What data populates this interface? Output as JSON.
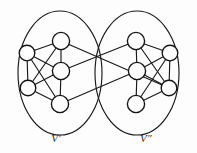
{
  "figure": {
    "type": "graph-diagram",
    "background_color": "#fdfdfd",
    "stroke_color": "#1a1a1a",
    "node_fill": "#ffffff"
  },
  "labels": {
    "left_cluster": "V′",
    "right_cluster": "V″"
  },
  "clusters": [
    {
      "id": "left",
      "label_key": "left_cluster",
      "ellipse": {
        "cx": 60,
        "cy": 73,
        "rx": 42,
        "ry": 62
      },
      "label_pos": {
        "x": 56,
        "y": 142
      },
      "nodes": [
        {
          "id": "L1",
          "cx": 61,
          "cy": 41,
          "r": 8.6
        },
        {
          "id": "L2",
          "cx": 27,
          "cy": 53,
          "r": 7.8
        },
        {
          "id": "L3",
          "cx": 61,
          "cy": 71,
          "r": 8.6
        },
        {
          "id": "L4",
          "cx": 28,
          "cy": 88,
          "r": 7.8
        },
        {
          "id": "L5",
          "cx": 60,
          "cy": 104,
          "r": 8.6
        }
      ],
      "edges": [
        [
          "L1",
          "L2"
        ],
        [
          "L1",
          "L3"
        ],
        [
          "L1",
          "L4"
        ],
        [
          "L2",
          "L3"
        ],
        [
          "L2",
          "L4"
        ],
        [
          "L2",
          "L5"
        ],
        [
          "L3",
          "L4"
        ],
        [
          "L3",
          "L5"
        ],
        [
          "L4",
          "L5"
        ]
      ]
    },
    {
      "id": "right",
      "label_key": "right_cluster",
      "ellipse": {
        "cx": 137,
        "cy": 73,
        "rx": 42,
        "ry": 62
      },
      "label_pos": {
        "x": 146,
        "y": 142
      },
      "nodes": [
        {
          "id": "R1",
          "cx": 136,
          "cy": 41,
          "r": 8.6
        },
        {
          "id": "R2",
          "cx": 170,
          "cy": 53,
          "r": 7.8
        },
        {
          "id": "R3",
          "cx": 137,
          "cy": 71,
          "r": 8.6
        },
        {
          "id": "R4",
          "cx": 169,
          "cy": 88,
          "r": 7.8
        },
        {
          "id": "R5",
          "cx": 136,
          "cy": 104,
          "r": 8.6
        }
      ],
      "edges": [
        [
          "R1",
          "R2"
        ],
        [
          "R1",
          "R3"
        ],
        [
          "R1",
          "R4"
        ],
        [
          "R2",
          "R3"
        ],
        [
          "R2",
          "R4"
        ],
        [
          "R3",
          "R4"
        ],
        [
          "R3",
          "R5"
        ],
        [
          "R4",
          "R5"
        ],
        [
          "R2",
          "R5"
        ]
      ]
    }
  ],
  "cross_edges": [
    {
      "from": "L1",
      "to": "R4",
      "from_pos": [
        61,
        41
      ],
      "to_pos": [
        169,
        88
      ]
    },
    {
      "from": "L3",
      "to": "R1",
      "from_pos": [
        61,
        71
      ],
      "to_pos": [
        136,
        41
      ]
    },
    {
      "from": "L5",
      "to": "R3",
      "from_pos": [
        60,
        104
      ],
      "to_pos": [
        137,
        71
      ]
    }
  ]
}
